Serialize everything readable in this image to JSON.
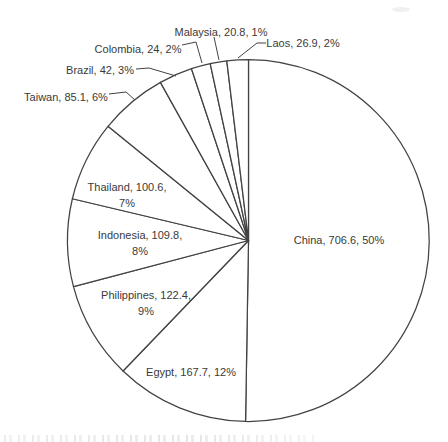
{
  "chart_data": {
    "type": "pie",
    "title": "",
    "legend": "none",
    "label_format": "category, value, percent",
    "start_angle_deg": 0,
    "direction": "clockwise",
    "total_value": 1405.9,
    "slices": [
      {
        "name": "China",
        "value": 706.6,
        "percent": 50,
        "percent_text": "50%",
        "label_lines": [
          "China, 706.6, 50%"
        ]
      },
      {
        "name": "Egypt",
        "value": 167.7,
        "percent": 12,
        "percent_text": "12%",
        "label_lines": [
          "Egypt, 167.7, 12%"
        ]
      },
      {
        "name": "Philippines",
        "value": 122.4,
        "percent": 9,
        "percent_text": "9%",
        "label_lines": [
          "Philippines, 122.4,",
          "9%"
        ]
      },
      {
        "name": "Indonesia",
        "value": 109.8,
        "percent": 8,
        "percent_text": "8%",
        "label_lines": [
          "Indonesia, 109.8,",
          "8%"
        ]
      },
      {
        "name": "Thailand",
        "value": 100.6,
        "percent": 7,
        "percent_text": "7%",
        "label_lines": [
          "Thailand, 100.6,",
          "7%"
        ]
      },
      {
        "name": "Taiwan",
        "value": 85.1,
        "percent": 6,
        "percent_text": "6%",
        "label_lines": [
          "Taiwan, 85.1, 6%"
        ]
      },
      {
        "name": "Brazil",
        "value": 42,
        "percent": 3,
        "percent_text": "3%",
        "label_lines": [
          "Brazil, 42, 3%"
        ]
      },
      {
        "name": "Colombia",
        "value": 24,
        "percent": 2,
        "percent_text": "2%",
        "label_lines": [
          "Colombia, 24, 2%"
        ]
      },
      {
        "name": "Malaysia",
        "value": 20.8,
        "percent": 1,
        "percent_text": "1%",
        "label_lines": [
          "Malaysia, 20.8, 1%"
        ]
      },
      {
        "name": "Laos",
        "value": 26.9,
        "percent": 2,
        "percent_text": "2%",
        "label_lines": [
          "Laos, 26.9, 2%"
        ]
      }
    ],
    "colors": {
      "background": "#ffffff",
      "slice_fill": "#ffffff",
      "line_stroke": "#424242",
      "label_text": "#3a3a3a"
    }
  }
}
